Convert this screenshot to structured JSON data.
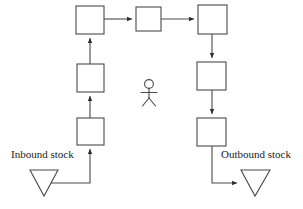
{
  "diagram": {
    "type": "process-flow",
    "background_color": "#ffffff",
    "stroke_color": "#3a3a3a",
    "box_fill": "#ffffff",
    "labels": {
      "inbound": "Inbound stock",
      "outbound": "Outbound stock"
    },
    "nodes": [
      {
        "id": "box-left-bottom",
        "name": "process-box-1",
        "x": 77,
        "y": 118,
        "w": 27,
        "h": 27,
        "label": ""
      },
      {
        "id": "box-left-middle",
        "name": "process-box-2",
        "x": 77,
        "y": 64,
        "w": 27,
        "h": 28,
        "label": ""
      },
      {
        "id": "box-top-left",
        "name": "process-box-3",
        "x": 76,
        "y": 6,
        "w": 28,
        "h": 28,
        "label": ""
      },
      {
        "id": "box-top-middle",
        "name": "process-box-4",
        "x": 136,
        "y": 7,
        "w": 25,
        "h": 24,
        "label": ""
      },
      {
        "id": "box-top-right",
        "name": "process-box-5",
        "x": 198,
        "y": 5,
        "w": 29,
        "h": 29,
        "label": ""
      },
      {
        "id": "box-right-middle",
        "name": "process-box-6",
        "x": 197,
        "y": 62,
        "w": 29,
        "h": 28,
        "label": ""
      },
      {
        "id": "box-right-bottom",
        "name": "process-box-7",
        "x": 197,
        "y": 118,
        "w": 29,
        "h": 28,
        "label": ""
      }
    ],
    "stores": [
      {
        "id": "inbound-store",
        "name": "inbound-stock-triangle",
        "points": "30,170 58,170 44,196",
        "label": "Inbound stock",
        "label_x": 11,
        "label_y": 158
      },
      {
        "id": "outbound-store",
        "name": "outbound-stock-triangle",
        "points": "241,170 270,170 255,196",
        "label": "Outbound stock",
        "label_x": 221,
        "label_y": 158
      }
    ],
    "actor": {
      "name": "stick-figure-actor",
      "head_cx": 149,
      "head_cy": 84,
      "head_r": 4.5,
      "body_top_y": 88.5,
      "body_bottom_y": 98,
      "arm_y": 92,
      "arm_left_x": 141,
      "arm_right_x": 157,
      "leg_left_x": 142,
      "leg_right_x": 156,
      "leg_bottom_y": 106
    },
    "connectors": [
      {
        "name": "flow-inbound-to-box1",
        "path": "M 44,183 L 90,183 L 90,148",
        "arrow": "up"
      },
      {
        "name": "flow-box1-to-box2",
        "path": "M 90,118 L 90,95",
        "arrow": "up"
      },
      {
        "name": "flow-box2-to-box3",
        "path": "M 90,64 L 90,37",
        "arrow": "up"
      },
      {
        "name": "flow-box3-to-box4",
        "path": "M 104,19 L 133,19",
        "arrow": "right"
      },
      {
        "name": "flow-box4-to-box5",
        "path": "M 161,19 L 195,19",
        "arrow": "right"
      },
      {
        "name": "flow-box5-to-box6",
        "path": "M 212,34 L 212,59",
        "arrow": "down"
      },
      {
        "name": "flow-box6-to-box7",
        "path": "M 212,90 L 212,115",
        "arrow": "down"
      },
      {
        "name": "flow-box7-to-outbound",
        "path": "M 212,146 L 212,183 L 238,183",
        "arrow": "right"
      }
    ]
  }
}
